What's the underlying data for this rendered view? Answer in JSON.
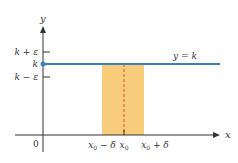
{
  "diagram": {
    "axes": {
      "x_label": "x",
      "y_label": "y",
      "origin_label": "0"
    },
    "y_ticks": [
      {
        "label": "k + ε"
      },
      {
        "label": "k"
      },
      {
        "label": "k − ε"
      }
    ],
    "x_ticks": [
      {
        "base": "x",
        "sub": "0",
        "suffix": " − δ"
      },
      {
        "base": "x",
        "sub": "0",
        "suffix": ""
      },
      {
        "base": "x",
        "sub": "0",
        "suffix": " + δ"
      }
    ],
    "line_label": "y = k",
    "colors": {
      "line": "#3a7fc4",
      "band": "#f7cc7a",
      "dashed": "#d9542f",
      "axis": "#333333"
    }
  }
}
